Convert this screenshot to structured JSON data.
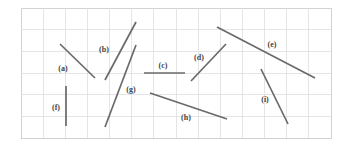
{
  "figure": {
    "kind": "line-segment-diagram",
    "background_color": "#ffffff",
    "frame": {
      "x": 21,
      "y": 8,
      "width": 310,
      "height": 130,
      "border_color": "#d2d2d2"
    },
    "grid": {
      "visible": true,
      "color": "#dedede",
      "columns": 14,
      "rows": 6,
      "cell_width": 22.14,
      "cell_height": 21.67
    }
  },
  "chart_data": {
    "type": "scatter",
    "title": "",
    "xlabel": "",
    "ylabel": "",
    "grid": true,
    "legend": "none",
    "line_color": "#6a6a6a",
    "segments": [
      {
        "label": "(a)",
        "x1": 60,
        "y1": 44,
        "x2": 95,
        "y2": 78,
        "label_x": 63,
        "label_y": 69
      },
      {
        "label": "(b)",
        "x1": 105,
        "y1": 80,
        "x2": 136,
        "y2": 22,
        "label_x": 104,
        "label_y": 50
      },
      {
        "label": "(c)",
        "x1": 144,
        "y1": 73,
        "x2": 185,
        "y2": 73,
        "label_x": 163,
        "label_y": 66
      },
      {
        "label": "(d)",
        "x1": 191,
        "y1": 81,
        "x2": 226,
        "y2": 44,
        "label_x": 199,
        "label_y": 58
      },
      {
        "label": "(e)",
        "x1": 217,
        "y1": 27,
        "x2": 315,
        "y2": 78,
        "label_x": 272,
        "label_y": 45
      },
      {
        "label": "(f)",
        "x1": 66,
        "y1": 86,
        "x2": 66,
        "y2": 126,
        "label_x": 56,
        "label_y": 108
      },
      {
        "label": "(g)",
        "x1": 105,
        "y1": 127,
        "x2": 136,
        "y2": 45,
        "label_x": 131,
        "label_y": 90
      },
      {
        "label": "(h)",
        "x1": 150,
        "y1": 93,
        "x2": 227,
        "y2": 119,
        "label_x": 186,
        "label_y": 118
      },
      {
        "label": "(i)",
        "x1": 261,
        "y1": 69,
        "x2": 288,
        "y2": 124,
        "label_x": 265,
        "label_y": 100
      }
    ]
  }
}
